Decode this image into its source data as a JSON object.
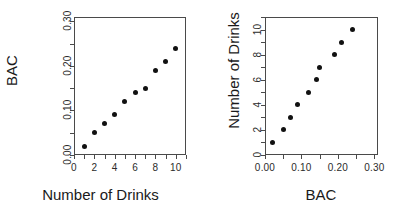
{
  "figure": {
    "background": "#ffffff",
    "point_color": "#111111",
    "axis_color": "#4a4a4a"
  },
  "chart_data": [
    {
      "type": "scatter",
      "title": "",
      "xlabel": "Number of Drinks",
      "ylabel": "BAC",
      "x": [
        1,
        2,
        3,
        4,
        5,
        6,
        7,
        8,
        9,
        10
      ],
      "y": [
        0.02,
        0.05,
        0.07,
        0.09,
        0.12,
        0.14,
        0.15,
        0.19,
        0.21,
        0.24
      ],
      "xlim": [
        0,
        11
      ],
      "ylim": [
        0.0,
        0.31
      ],
      "xticks": [
        0,
        2,
        4,
        6,
        8,
        10
      ],
      "xticklabels": [
        "0",
        "2",
        "4",
        "6",
        "8",
        "10"
      ],
      "xminorticks": [
        1,
        3,
        5,
        7,
        9,
        11
      ],
      "yticks": [
        0.0,
        0.1,
        0.2,
        0.3
      ],
      "yticklabels": [
        "0.00",
        "0.10",
        "0.20",
        "0.30"
      ],
      "yminorticks": [
        0.05,
        0.15,
        0.25
      ],
      "grid": false,
      "legend": false,
      "marker": "filled-circle"
    },
    {
      "type": "scatter",
      "title": "",
      "xlabel": "BAC",
      "ylabel": "Number of Drinks",
      "x": [
        0.02,
        0.05,
        0.07,
        0.09,
        0.12,
        0.14,
        0.15,
        0.19,
        0.21,
        0.24
      ],
      "y": [
        1,
        2,
        3,
        4,
        5,
        6,
        7,
        8,
        9,
        10
      ],
      "xlim": [
        0.0,
        0.31
      ],
      "ylim": [
        0,
        11
      ],
      "xticks": [
        0.0,
        0.1,
        0.2,
        0.3
      ],
      "xticklabels": [
        "0.00",
        "0.10",
        "0.20",
        "0.30"
      ],
      "xminorticks": [
        0.05,
        0.15,
        0.25
      ],
      "yticks": [
        0,
        2,
        4,
        6,
        8,
        10
      ],
      "yticklabels": [
        "0",
        "2",
        "4",
        "6",
        "8",
        "10"
      ],
      "yminorticks": [
        1,
        3,
        5,
        7,
        9,
        11
      ],
      "grid": false,
      "legend": false,
      "marker": "filled-circle"
    }
  ]
}
